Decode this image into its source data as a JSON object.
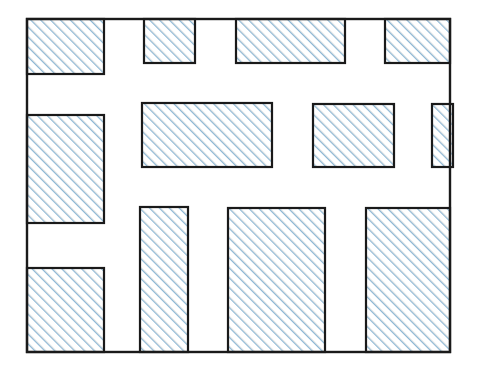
{
  "figure": {
    "canvas": {
      "width": 478,
      "height": 378,
      "background": "#ffffff"
    },
    "outer_frame": {
      "name": "outer-boundary-rectangle",
      "x": 27,
      "y": 19,
      "width": 423,
      "height": 333,
      "stroke": "#1a1a1a",
      "stroke_width": 2.4,
      "fill": "none"
    },
    "hatch": {
      "angle_deg": 45,
      "direction": "lower-left to upper-right",
      "spacing_px": 7,
      "line_width_px": 2.1,
      "color": "#8db8d6",
      "secondary_color": "#b9bfbf",
      "background": "#ffffff"
    },
    "rect_style": {
      "stroke": "#1a1a1a",
      "stroke_width": 2.2
    },
    "rectangles": [
      {
        "id": "r1",
        "name": "rect-top-1",
        "row": "top",
        "x": 27,
        "y": 19,
        "width": 77,
        "height": 55
      },
      {
        "id": "r2",
        "name": "rect-top-2",
        "row": "top",
        "x": 144,
        "y": 19,
        "width": 51,
        "height": 44
      },
      {
        "id": "r3",
        "name": "rect-top-3",
        "row": "top",
        "x": 236,
        "y": 19,
        "width": 109,
        "height": 44
      },
      {
        "id": "r4",
        "name": "rect-top-4",
        "row": "top",
        "x": 385,
        "y": 19,
        "width": 65,
        "height": 44
      },
      {
        "id": "r5",
        "name": "rect-middle-left",
        "row": "middle",
        "x": 27,
        "y": 115,
        "width": 77,
        "height": 108
      },
      {
        "id": "r6",
        "name": "rect-middle-center",
        "row": "middle",
        "x": 142,
        "y": 103,
        "width": 130,
        "height": 64
      },
      {
        "id": "r7",
        "name": "rect-middle-right",
        "row": "middle",
        "x": 313,
        "y": 104,
        "width": 81,
        "height": 63
      },
      {
        "id": "r8",
        "name": "rect-middle-far-right",
        "row": "middle",
        "x": 432,
        "y": 104,
        "width": 21,
        "height": 63
      },
      {
        "id": "r9",
        "name": "rect-bottom-1",
        "row": "bottom",
        "x": 27,
        "y": 268,
        "width": 77,
        "height": 84
      },
      {
        "id": "r10",
        "name": "rect-bottom-2",
        "row": "bottom",
        "x": 140,
        "y": 207,
        "width": 48,
        "height": 145
      },
      {
        "id": "r11",
        "name": "rect-bottom-3",
        "row": "bottom",
        "x": 228,
        "y": 208,
        "width": 97,
        "height": 144
      },
      {
        "id": "r12",
        "name": "rect-bottom-4",
        "row": "bottom",
        "x": 366,
        "y": 208,
        "width": 84,
        "height": 144
      }
    ]
  }
}
